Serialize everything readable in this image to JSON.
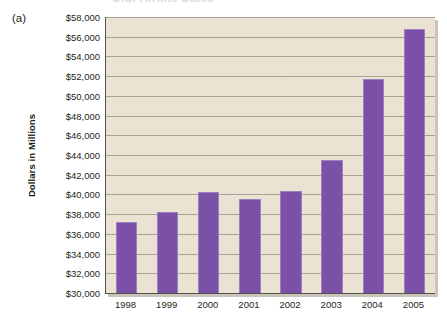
{
  "panel": {
    "label": "(a)"
  },
  "title": {
    "text": "U.S. Airline Sales",
    "visible_fragment": true
  },
  "axes": {
    "y_title": "Dollars in Millions",
    "y_ticks": [
      "$58,000",
      "$56,000",
      "$54,000",
      "$52,000",
      "$50,000",
      "$48,000",
      "$46,000",
      "$44,000",
      "$42,000",
      "$40,000",
      "$38,000",
      "$36,000",
      "$34,000",
      "$32,000",
      "$30,000"
    ],
    "x_ticks": [
      "1998",
      "1999",
      "2000",
      "2001",
      "2002",
      "2003",
      "2004",
      "2005"
    ]
  },
  "colors": {
    "bar": "#7a51a6",
    "bar_edge": "#9e7fc0",
    "plot_background": "#eae2d2",
    "gridline": "#a9a295",
    "axis": "#55514c",
    "text": "#231f20"
  },
  "chart_data": {
    "type": "bar",
    "title": "U.S. Airline Sales",
    "xlabel": "",
    "ylabel": "Dollars in Millions",
    "categories": [
      "1998",
      "1999",
      "2000",
      "2001",
      "2002",
      "2003",
      "2004",
      "2005"
    ],
    "values": [
      37200,
      38200,
      40200,
      39500,
      40400,
      43500,
      51700,
      56800
    ],
    "ylim": [
      30000,
      58000
    ],
    "ytick_step": 2000,
    "grid": true,
    "legend": false
  }
}
